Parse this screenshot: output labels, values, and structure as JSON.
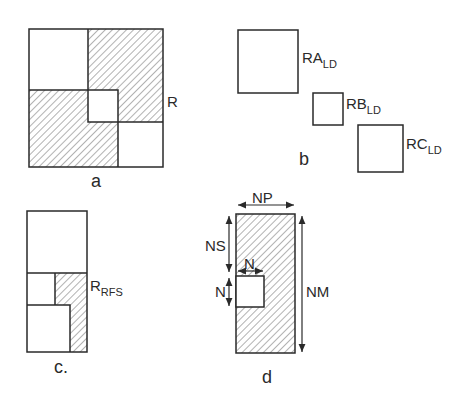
{
  "panels": {
    "a": {
      "caption": "a",
      "label": "R"
    },
    "b": {
      "caption": "b",
      "labels": [
        {
          "main": "RA",
          "sub": "LD"
        },
        {
          "main": "RB",
          "sub": "LD"
        },
        {
          "main": "RC",
          "sub": "LD"
        }
      ]
    },
    "c": {
      "caption": "c.",
      "label": {
        "main": "R",
        "sub": "RFS"
      }
    },
    "d": {
      "caption": "d",
      "dimensions": {
        "width": "NP",
        "offset": "NS",
        "block_width": "N",
        "block_height": "N",
        "height": "NM"
      }
    }
  },
  "colors": {
    "line": "#2a2a2a",
    "hatch": "#555555",
    "background": "#ffffff"
  }
}
